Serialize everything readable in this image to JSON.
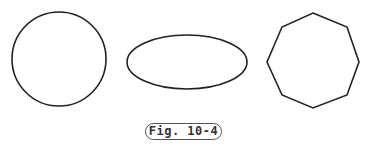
{
  "figure": {
    "caption": "Fig. 10-4",
    "stroke_color": "#222222",
    "shapes": [
      {
        "type": "circle",
        "cx": 59,
        "cy": 59,
        "r": 47
      },
      {
        "type": "ellipse",
        "cx": 187,
        "cy": 62,
        "rx": 60,
        "ry": 27
      },
      {
        "type": "octagon",
        "points": "313,13 347,27 359,62 347,95 313,108 282,95 267,62 282,27"
      }
    ]
  }
}
